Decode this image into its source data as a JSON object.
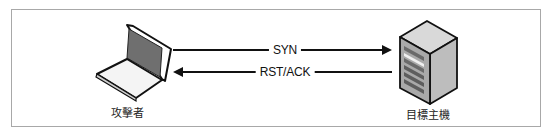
{
  "diagram": {
    "attacker": {
      "label": "攻擊者",
      "icon": "laptop-icon"
    },
    "target": {
      "label": "目標主機",
      "icon": "server-icon"
    },
    "messages": [
      {
        "label": "SYN",
        "direction": "attacker-to-target"
      },
      {
        "label": "RST/ACK",
        "direction": "target-to-attacker"
      }
    ]
  }
}
